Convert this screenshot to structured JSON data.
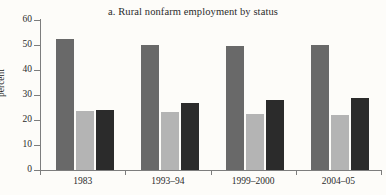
{
  "chart_data": {
    "type": "bar",
    "title": "a. Rural nonfarm employment by status",
    "xlabel": "",
    "ylabel": "percent",
    "ylim": [
      0,
      60
    ],
    "yticks": [
      0,
      10,
      20,
      30,
      40,
      50,
      60
    ],
    "grid": false,
    "legend": "none",
    "categories": [
      "1983",
      "1993–94",
      "1999–2000",
      "2004–05"
    ],
    "series": [
      {
        "name": "series-1",
        "color": "#696969",
        "values": [
          52.5,
          50.2,
          49.5,
          50.0
        ]
      },
      {
        "name": "series-2",
        "color": "#b4b4b4",
        "values": [
          23.5,
          23.4,
          22.6,
          22.1
        ]
      },
      {
        "name": "series-3",
        "color": "#2b2b2b",
        "values": [
          24.2,
          27.0,
          28.2,
          28.8
        ]
      }
    ]
  },
  "axis": {
    "y_tick_labels": [
      "0",
      "10",
      "20",
      "30",
      "40",
      "50",
      "60"
    ],
    "y_title": "percent",
    "x_tick_labels": [
      "1983",
      "1993–94",
      "1999–2000",
      "2004–05"
    ]
  },
  "colors": {
    "background": "#fdfcf9",
    "axis": "#7d7d7d",
    "text": "#2b2b2b",
    "series_1": "#696969",
    "series_2": "#b4b4b4",
    "series_3": "#2b2b2b"
  }
}
